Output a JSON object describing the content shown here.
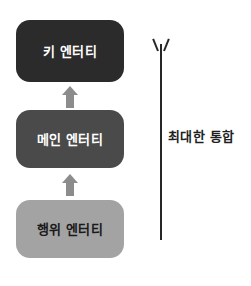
{
  "diagram": {
    "type": "vertical-hierarchy-flow",
    "background_color": "#ffffff",
    "entities": [
      {
        "id": "key-entity",
        "label": "키 엔터티",
        "level": "top",
        "fill_color": "#2b2b2b",
        "text_color": "#ffffff"
      },
      {
        "id": "main-entity",
        "label": "메인 엔터티",
        "level": "middle",
        "fill_color": "#4a4a4a",
        "text_color": "#ffffff"
      },
      {
        "id": "action-entity",
        "label": "행위 엔터티",
        "level": "bottom",
        "fill_color": "#a3a3a3",
        "text_color": "#1a1a1a"
      }
    ],
    "connectors": [
      {
        "id": "arrow-action-to-main",
        "from": "action-entity",
        "to": "main-entity",
        "direction": "up",
        "style": "block-arrow",
        "color": "#8c8c8c"
      },
      {
        "id": "arrow-main-to-key",
        "from": "main-entity",
        "to": "key-entity",
        "direction": "up",
        "style": "block-arrow",
        "color": "#8c8c8c"
      }
    ],
    "annotation": {
      "id": "integration-axis",
      "label": "최대한 통합",
      "direction": "up",
      "line_color": "#262626",
      "text_color": "#1f1f1f"
    }
  }
}
